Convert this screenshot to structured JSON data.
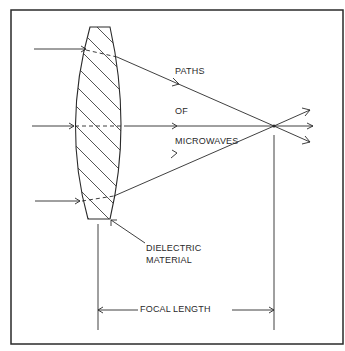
{
  "diagram": {
    "type": "microwave dielectric lens ray diagram",
    "labels": {
      "paths": "PATHS",
      "of": "OF",
      "microwaves": "MICROWAVES",
      "dielectric_line1": "DIELECTRIC",
      "dielectric_line2": "MATERIAL",
      "focal": "FOCAL",
      "length": "LENGTH"
    },
    "elements": {
      "lens": "dielectric lens (hatched)",
      "incoming_rays": 3,
      "outgoing_rays": 3,
      "focal_point": "intersection of rays"
    },
    "colors": {
      "line": "#2a2a2a",
      "background": "#ffffff"
    }
  }
}
